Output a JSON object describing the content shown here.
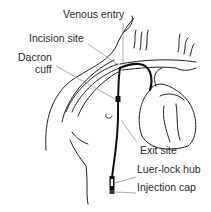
{
  "diagram": {
    "labels": {
      "venous_entry": "Venous entry",
      "incision_site": "Incision site",
      "dacron_cuff_line1": "Dacron",
      "dacron_cuff_line2": "cuff",
      "exit_site": "Exit site",
      "luer_lock_hub": "Luer-lock hub",
      "injection_cap": "Injection cap"
    },
    "colors": {
      "line": "#222222",
      "leader": "#777777",
      "background": "#ffffff"
    }
  }
}
